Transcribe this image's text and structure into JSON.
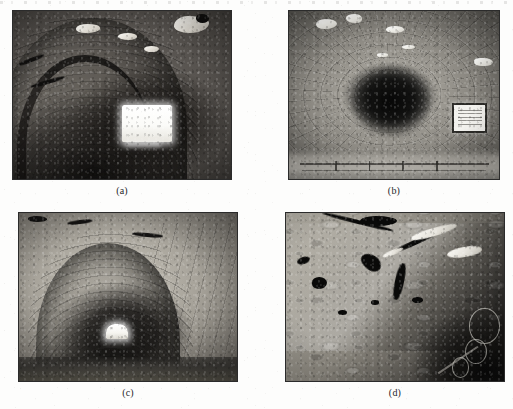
{
  "figure": {
    "type": "photo-grid",
    "rows": 2,
    "columns": 2,
    "background_color": "#fdfdfc",
    "border_color": "#2b2b2b",
    "caption_color": "#26262a",
    "panels": [
      {
        "id": "a",
        "caption": "(a)",
        "subject": "tunnel-arch-interior-with-bright-opening",
        "description": "Grayscale photograph looking into a masonry-lined tunnel arch; coursed stone ring visible on the vault, dark interior with a bright rectangular daylight opening at mid-right and pale spalled patches along the crown.",
        "color_mode": "grayscale"
      },
      {
        "id": "b",
        "caption": "(b)",
        "subject": "tunnel-bore-receding-into-darkness-with-wall-sign",
        "description": "Grayscale photograph down the axis of a segment-lined tunnel; radial ring joints converge on a dark vanishing point, a light floor with a low rail runs along the invert, and a white rectangular sign is mounted on the right-hand wall.",
        "color_mode": "grayscale"
      },
      {
        "id": "c",
        "caption": "(c)",
        "subject": "rough-hewn-tunnel-arch-with-distant-light",
        "description": "Grayscale photograph of a rough rock-cut and block-lined tunnel arch; heavily pitted crown surface, concentric masonry courses on the vault, and a small bright opening at the far end of the bore.",
        "color_mode": "grayscale"
      },
      {
        "id": "d",
        "caption": "(d)",
        "subject": "close-up-of-cracked-and-spalled-tunnel-lining",
        "description": "Grayscale close-up of a damaged tunnel lining surface showing dark branching cracks, voids and spalled concrete across a bright diagonal ridge, with shadowed equipment and circular fittings in the lower-right corner.",
        "color_mode": "grayscale"
      }
    ]
  }
}
